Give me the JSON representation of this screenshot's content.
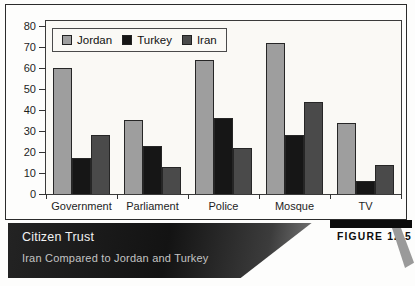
{
  "figure": {
    "title": "Citizen Trust",
    "subtitle": "Iran Compared to Jordan and Turkey",
    "label": "FIGURE 12.5"
  },
  "chart_data": {
    "type": "bar",
    "title": "Citizen Trust",
    "subtitle": "Iran Compared to Jordan and Turkey",
    "categories": [
      "Government",
      "Parliament",
      "Police",
      "Mosque",
      "TV"
    ],
    "series": [
      {
        "name": "Jordan",
        "color": "#9e9e9e",
        "values": [
          60,
          35,
          64,
          72,
          34
        ]
      },
      {
        "name": "Turkey",
        "color": "#161616",
        "values": [
          17,
          23,
          36,
          28,
          6
        ]
      },
      {
        "name": "Iran",
        "color": "#4a4a4a",
        "values": [
          28,
          13,
          22,
          44,
          14
        ]
      }
    ],
    "xlabel": "",
    "ylabel": "",
    "ylim": [
      0,
      80
    ],
    "yticks": [
      0,
      10,
      20,
      30,
      40,
      50,
      60,
      70,
      80
    ],
    "grid": false,
    "legend_position": "top-left",
    "colors": {
      "plot_background": "#faf9f5",
      "bar_outline": "#262626",
      "caption_band_dark": "#131313",
      "caption_band_light": "#8f8f8f",
      "figure_tab": "#0c0c0c"
    }
  }
}
